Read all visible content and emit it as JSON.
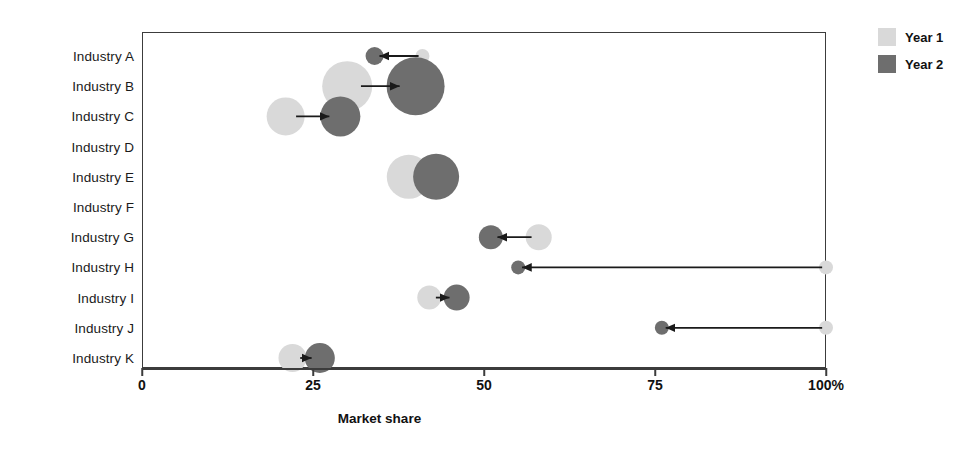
{
  "chart_data": {
    "type": "scatter",
    "title": "",
    "xlabel": "Market share",
    "ylabel": "",
    "xlim": [
      0,
      100
    ],
    "grid": false,
    "legend_position": "top-right",
    "x_tick_labels": [
      "0",
      "25",
      "50",
      "75",
      "100%"
    ],
    "x_ticks": [
      0,
      25,
      50,
      75,
      100
    ],
    "categories": [
      "Industry A",
      "Industry B",
      "Industry C",
      "Industry D",
      "Industry E",
      "Industry F",
      "Industry G",
      "Industry H",
      "Industry I",
      "Industry J",
      "Industry K"
    ],
    "legend": [
      {
        "name": "Year 1",
        "color": "#d9d9d9"
      },
      {
        "name": "Year 2",
        "color": "#6e6e6e"
      }
    ],
    "series": [
      {
        "name": "Year 1",
        "values": [
          41,
          30,
          21,
          31,
          39,
          42,
          58,
          100,
          42,
          100,
          22
        ]
      },
      {
        "name": "Year 2",
        "values": [
          34,
          40,
          29,
          38,
          43,
          46,
          51,
          55,
          46,
          76,
          26
        ]
      }
    ],
    "bubble_sizes_year1": [
      13,
      50,
      38,
      0,
      44,
      0,
      25,
      13,
      23,
      13,
      27
    ],
    "bubble_sizes_year2": [
      17,
      58,
      40,
      0,
      45,
      0,
      23,
      13,
      25,
      13,
      29
    ],
    "points": [
      {
        "category": "Industry A",
        "year1": 41,
        "year2": 34,
        "direction": "left",
        "r1": 7,
        "r2": 9
      },
      {
        "category": "Industry B",
        "year1": 30,
        "year2": 40,
        "direction": "right",
        "r1": 25,
        "r2": 29
      },
      {
        "category": "Industry C",
        "year1": 21,
        "year2": 29,
        "direction": "right",
        "r1": 19,
        "r2": 20
      },
      {
        "category": "Industry D",
        "year1": 31,
        "year2": 38,
        "direction": "right",
        "r1": 0,
        "r2": 0
      },
      {
        "category": "Industry E",
        "year1": 39,
        "year2": 43,
        "direction": "right",
        "r1": 22,
        "r2": 23
      },
      {
        "category": "Industry F",
        "year1": 42,
        "year2": 46,
        "direction": "right",
        "r1": 0,
        "r2": 0
      },
      {
        "category": "Industry G",
        "year1": 58,
        "year2": 51,
        "direction": "left",
        "r1": 13,
        "r2": 12
      },
      {
        "category": "Industry H",
        "year1": 100,
        "year2": 55,
        "direction": "left",
        "r1": 7,
        "r2": 7
      },
      {
        "category": "Industry I",
        "year1": 42,
        "year2": 46,
        "direction": "right",
        "r1": 12,
        "r2": 13
      },
      {
        "category": "Industry J",
        "year1": 100,
        "year2": 76,
        "direction": "left",
        "r1": 7,
        "r2": 7
      },
      {
        "category": "Industry K",
        "year1": 22,
        "year2": 26,
        "direction": "right",
        "r1": 14,
        "r2": 15
      }
    ]
  }
}
